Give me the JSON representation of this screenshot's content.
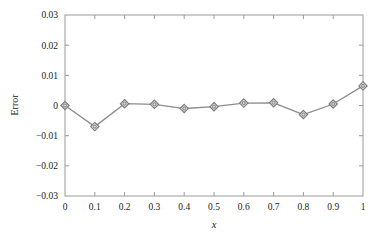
{
  "chart_data": {
    "type": "line",
    "title": "",
    "subtitle": "",
    "xlabel": "x",
    "ylabel": "Error",
    "x": [
      0,
      0.1,
      0.2,
      0.3,
      0.4,
      0.5,
      0.6,
      0.7,
      0.8,
      0.9,
      1
    ],
    "values": [
      0.0,
      -0.007,
      0.0006,
      0.0004,
      -0.001,
      -0.0004,
      0.0008,
      0.0009,
      -0.003,
      0.0005,
      0.0065
    ],
    "series": [
      {
        "name": "Error",
        "values": [
          0.0,
          -0.007,
          0.0006,
          0.0004,
          -0.001,
          -0.0004,
          0.0008,
          0.0009,
          -0.003,
          0.0005,
          0.0065
        ]
      }
    ],
    "xlim": [
      0,
      1
    ],
    "ylim": [
      -0.03,
      0.03
    ],
    "xticks": [
      0,
      0.1,
      0.2,
      0.3,
      0.4,
      0.5,
      0.6,
      0.7,
      0.8,
      0.9,
      1
    ],
    "xtick_labels": [
      "0",
      "0.1",
      "0.2",
      "0.3",
      "0.4",
      "0.5",
      "0.6",
      "0.7",
      "0.8",
      "0.9",
      "1"
    ],
    "yticks": [
      0.03,
      0.02,
      0.01,
      0,
      -0.01,
      -0.02,
      -0.03
    ],
    "ytick_labels": [
      "0.03",
      "0.02",
      "0.01",
      "0",
      "−0.01",
      "−0.02",
      "−0.03"
    ],
    "grid": false,
    "legend": "none",
    "marker": "diamond",
    "line_color": "#8c8c8c",
    "marker_edge_color": "#7a7a7a",
    "marker_face_color": "#d9d9d9",
    "axis_color": "#9a9a9a",
    "background_color": "#ffffff"
  }
}
